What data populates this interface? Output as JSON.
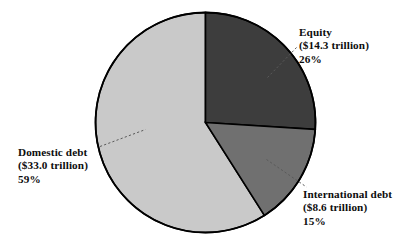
{
  "chart_data": {
    "type": "pie",
    "title": "",
    "subtitle": "",
    "xlabel": "",
    "ylabel": "",
    "legend_position": "callout-labels",
    "grid": false,
    "units": "trillion USD",
    "categories": [
      "Equity",
      "Domestic debt",
      "International debt"
    ],
    "values": [
      14.3,
      33.0,
      8.6
    ],
    "percentages": [
      26,
      59,
      15
    ],
    "start_angle_deg": 0,
    "direction": "clockwise",
    "slices": [
      {
        "name": "Equity",
        "value": 14.3,
        "value_label": "($14.3 trillion)",
        "percent": 26,
        "percent_label": "26%",
        "color": "#3d3d3d",
        "start_deg": 0,
        "end_deg": 93.6
      },
      {
        "name": "International debt",
        "value": 8.6,
        "value_label": "($8.6 trillion)",
        "percent": 15,
        "percent_label": "15%",
        "color": "#707070",
        "start_deg": 93.6,
        "end_deg": 147.6
      },
      {
        "name": "Domestic debt",
        "value": 33.0,
        "value_label": "($33.0 trillion)",
        "percent": 59,
        "percent_label": "59%",
        "color": "#c9c9c9",
        "start_deg": 147.6,
        "end_deg": 360
      }
    ]
  },
  "labels": {
    "equity": {
      "name": "Equity",
      "amount": "($14.3 trillion)",
      "percent": "26%"
    },
    "domestic": {
      "name": "Domestic debt",
      "amount": "($33.0 trillion)",
      "percent": "59%"
    },
    "international": {
      "name": "International debt",
      "amount": "($8.6 trillion)",
      "percent": "15%"
    }
  },
  "style": {
    "background": "#ffffff",
    "outline": "#000000",
    "equity_color": "#3d3d3d",
    "international_color": "#707070",
    "domestic_color": "#c9c9c9",
    "text_color": "#0d0d0d"
  }
}
